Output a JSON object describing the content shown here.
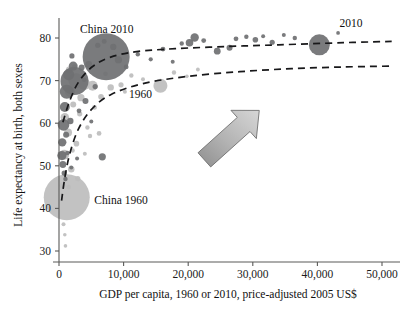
{
  "chart_data": {
    "type": "scatter",
    "title": "",
    "subtitle": "",
    "xlabel": "GDP per capita, 1960 or 2010, price-adjusted 2005 US$",
    "ylabel": "Life expectancy at birth, both sexes",
    "xlim": [
      0,
      52000
    ],
    "ylim": [
      28,
      84
    ],
    "grid": false,
    "legend": "none",
    "bubble_encoding": "marker area proportional to population",
    "xticks": [
      0,
      10000,
      20000,
      30000,
      40000,
      50000
    ],
    "xticklabels": [
      "0",
      "10,000",
      "20,000",
      "30,000",
      "40,000",
      "50,000"
    ],
    "yticks": [
      30,
      40,
      50,
      60,
      70,
      80
    ],
    "yticklabels": [
      "30",
      "40",
      "50",
      "60",
      "70",
      "80"
    ],
    "annotations": [
      {
        "text": "China 2010",
        "x": 7400,
        "y": 81.2,
        "name": "china-2010-label"
      },
      {
        "text": "China 1960",
        "x": 9600,
        "y": 41.0,
        "name": "china-1960-label"
      },
      {
        "text": "1960",
        "x": 12600,
        "y": 66.0,
        "name": "series-1960-label"
      },
      {
        "text": "2010",
        "x": 45200,
        "y": 82.6,
        "name": "series-2010-label"
      }
    ],
    "series": [
      {
        "name": "2010",
        "color": "#6f7072",
        "trendline": {
          "label": "2010",
          "dash": true,
          "points": [
            [
              600,
              60.2
            ],
            [
              1600,
              65.0
            ],
            [
              3000,
              69.6
            ],
            [
              5200,
              73.3
            ],
            [
              8000,
              75.5
            ],
            [
              12000,
              76.8
            ],
            [
              18000,
              77.5
            ],
            [
              26000,
              78.0
            ],
            [
              34000,
              78.4
            ],
            [
              44000,
              78.9
            ],
            [
              51500,
              79.2
            ]
          ]
        },
        "points": [
          {
            "x": 7300,
            "y": 75.6,
            "r": 23.5
          },
          {
            "x": 2400,
            "y": 69.9,
            "r": 14.0
          },
          {
            "x": 1200,
            "y": 67.4,
            "r": 7.0
          },
          {
            "x": 1500,
            "y": 71.4,
            "r": 5.5
          },
          {
            "x": 2200,
            "y": 73.4,
            "r": 4.5
          },
          {
            "x": 900,
            "y": 63.8,
            "r": 5.0
          },
          {
            "x": 700,
            "y": 59.6,
            "r": 5.8
          },
          {
            "x": 500,
            "y": 55.5,
            "r": 4.2
          },
          {
            "x": 450,
            "y": 52.4,
            "r": 4.6
          },
          {
            "x": 600,
            "y": 50.3,
            "r": 3.4
          },
          {
            "x": 1100,
            "y": 57.3,
            "r": 3.0
          },
          {
            "x": 1750,
            "y": 60.5,
            "r": 3.2
          },
          {
            "x": 3500,
            "y": 73.1,
            "r": 3.0
          },
          {
            "x": 4600,
            "y": 73.8,
            "r": 3.4
          },
          {
            "x": 6000,
            "y": 78.3,
            "r": 2.6
          },
          {
            "x": 7000,
            "y": 79.2,
            "r": 2.4
          },
          {
            "x": 8400,
            "y": 77.9,
            "r": 3.1
          },
          {
            "x": 9200,
            "y": 74.9,
            "r": 3.6
          },
          {
            "x": 10400,
            "y": 73.2,
            "r": 2.4
          },
          {
            "x": 12200,
            "y": 76.2,
            "r": 2.2
          },
          {
            "x": 14200,
            "y": 75.0,
            "r": 2.1
          },
          {
            "x": 16100,
            "y": 77.4,
            "r": 2.4
          },
          {
            "x": 17600,
            "y": 74.4,
            "r": 2.0
          },
          {
            "x": 19000,
            "y": 78.7,
            "r": 2.2
          },
          {
            "x": 20200,
            "y": 78.9,
            "r": 3.8
          },
          {
            "x": 21000,
            "y": 80.1,
            "r": 4.2
          },
          {
            "x": 22400,
            "y": 79.4,
            "r": 2.4
          },
          {
            "x": 24500,
            "y": 76.9,
            "r": 3.4
          },
          {
            "x": 26400,
            "y": 77.7,
            "r": 3.0
          },
          {
            "x": 27400,
            "y": 79.8,
            "r": 2.4
          },
          {
            "x": 29000,
            "y": 80.3,
            "r": 2.2
          },
          {
            "x": 30400,
            "y": 79.6,
            "r": 2.8
          },
          {
            "x": 31600,
            "y": 80.4,
            "r": 2.0
          },
          {
            "x": 33000,
            "y": 79.0,
            "r": 2.6
          },
          {
            "x": 34800,
            "y": 80.7,
            "r": 2.0
          },
          {
            "x": 36500,
            "y": 80.0,
            "r": 2.2
          },
          {
            "x": 40300,
            "y": 78.4,
            "r": 10.5
          },
          {
            "x": 43200,
            "y": 81.2,
            "r": 1.9
          },
          {
            "x": 1000,
            "y": 46.9,
            "r": 2.2
          },
          {
            "x": 800,
            "y": 48.3,
            "r": 2.6
          },
          {
            "x": 1300,
            "y": 53.0,
            "r": 2.2
          },
          {
            "x": 2800,
            "y": 51.7,
            "r": 2.0
          },
          {
            "x": 4100,
            "y": 65.2,
            "r": 3.0
          },
          {
            "x": 5600,
            "y": 68.6,
            "r": 2.6
          },
          {
            "x": 6700,
            "y": 52.1,
            "r": 3.6
          },
          {
            "x": 1900,
            "y": 49.6,
            "r": 2.0
          },
          {
            "x": 3100,
            "y": 62.9,
            "r": 2.4
          },
          {
            "x": 2000,
            "y": 75.8,
            "r": 2.6
          },
          {
            "x": 3900,
            "y": 70.2,
            "r": 2.2
          },
          {
            "x": 5000,
            "y": 60.4,
            "r": 2.0
          }
        ]
      },
      {
        "name": "1960",
        "color": "#bdbdbd",
        "trendline": {
          "label": "1960",
          "dash": true,
          "points": [
            [
              400,
              41.8
            ],
            [
              900,
              47.2
            ],
            [
              1700,
              53.0
            ],
            [
              3000,
              58.6
            ],
            [
              5000,
              63.2
            ],
            [
              8000,
              66.7
            ],
            [
              13000,
              69.3
            ],
            [
              20000,
              71.0
            ],
            [
              28000,
              72.1
            ],
            [
              36000,
              72.8
            ],
            [
              44000,
              73.2
            ],
            [
              51500,
              73.4
            ]
          ]
        },
        "points": [
          {
            "x": 1200,
            "y": 42.6,
            "r": 23.0
          },
          {
            "x": 2600,
            "y": 70.0,
            "r": 7.5
          },
          {
            "x": 3900,
            "y": 69.2,
            "r": 6.0
          },
          {
            "x": 5200,
            "y": 68.8,
            "r": 5.0
          },
          {
            "x": 1700,
            "y": 67.4,
            "r": 5.2
          },
          {
            "x": 900,
            "y": 61.4,
            "r": 4.2
          },
          {
            "x": 1400,
            "y": 57.8,
            "r": 4.0
          },
          {
            "x": 800,
            "y": 52.6,
            "r": 5.0
          },
          {
            "x": 1900,
            "y": 49.2,
            "r": 3.2
          },
          {
            "x": 2900,
            "y": 47.0,
            "r": 2.6
          },
          {
            "x": 500,
            "y": 45.4,
            "r": 3.0
          },
          {
            "x": 700,
            "y": 36.3,
            "r": 2.0
          },
          {
            "x": 900,
            "y": 33.8,
            "r": 1.8
          },
          {
            "x": 1000,
            "y": 31.2,
            "r": 1.8
          },
          {
            "x": 2200,
            "y": 64.4,
            "r": 3.0
          },
          {
            "x": 3200,
            "y": 62.2,
            "r": 2.6
          },
          {
            "x": 4400,
            "y": 59.0,
            "r": 2.2
          },
          {
            "x": 5500,
            "y": 63.7,
            "r": 2.4
          },
          {
            "x": 6500,
            "y": 66.2,
            "r": 2.8
          },
          {
            "x": 8000,
            "y": 68.4,
            "r": 3.2
          },
          {
            "x": 9600,
            "y": 69.0,
            "r": 2.6
          },
          {
            "x": 11200,
            "y": 71.2,
            "r": 2.2
          },
          {
            "x": 13000,
            "y": 70.3,
            "r": 2.0
          },
          {
            "x": 15700,
            "y": 68.8,
            "r": 7.0
          },
          {
            "x": 17800,
            "y": 71.9,
            "r": 2.2
          },
          {
            "x": 19800,
            "y": 71.0,
            "r": 1.8
          },
          {
            "x": 1600,
            "y": 72.5,
            "r": 3.4
          },
          {
            "x": 2400,
            "y": 73.2,
            "r": 2.6
          },
          {
            "x": 3400,
            "y": 66.0,
            "r": 3.6
          },
          {
            "x": 4800,
            "y": 57.0,
            "r": 2.2
          },
          {
            "x": 6200,
            "y": 57.6,
            "r": 2.4
          },
          {
            "x": 2700,
            "y": 55.2,
            "r": 2.8
          },
          {
            "x": 1500,
            "y": 45.0,
            "r": 2.4
          },
          {
            "x": 2100,
            "y": 53.6,
            "r": 2.2
          },
          {
            "x": 4000,
            "y": 52.8,
            "r": 2.0
          },
          {
            "x": 7200,
            "y": 71.6,
            "r": 2.4
          },
          {
            "x": 10200,
            "y": 67.4,
            "r": 2.0
          },
          {
            "x": 21500,
            "y": 72.6,
            "r": 1.9
          }
        ]
      }
    ],
    "arrow": {
      "name": "growth-arrow",
      "from": [
        22500,
        51.4
      ],
      "to": [
        31000,
        63.0
      ],
      "fill": "#a7a7a7",
      "stroke": "#6d6d6d",
      "description": "large gray block arrow pointing up and to the right"
    }
  }
}
